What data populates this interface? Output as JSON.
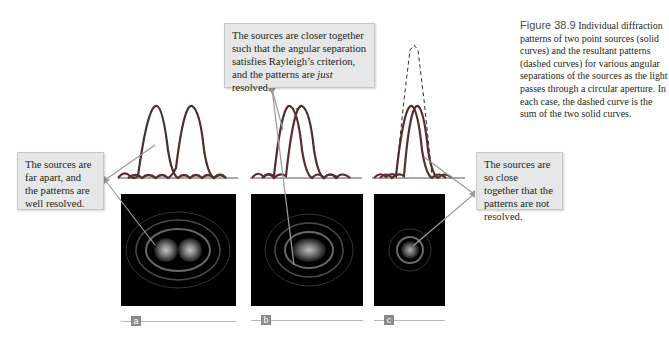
{
  "figure": {
    "number": "Figure 38.9",
    "caption": "Individual diffraction patterns of two point sources (solid curves) and the resultant patterns (dashed curves) for various angular separations of the sources as the light passes through a circular aperture. In each case, the dashed curve is the sum of the two solid curves."
  },
  "callouts": {
    "a": "The sources are far apart, and the patterns are well resolved.",
    "b_pre": "The sources are closer together such that the angular separation satisfies Rayleigh’s criterion, and the patterns are ",
    "b_em": "just",
    "b_post": " resolved.",
    "c": "The sources are so close together that the patterns are not resolved."
  },
  "panels": [
    {
      "label": "a",
      "separation": "far apart",
      "resolved": "well resolved"
    },
    {
      "label": "b",
      "separation": "Rayleigh criterion",
      "resolved": "just resolved"
    },
    {
      "label": "c",
      "separation": "very close",
      "resolved": "not resolved"
    }
  ],
  "colors": {
    "solid_curve": "#5a2e2e",
    "dashed_curve": "#333333",
    "callout_bg": "#e6e7e8",
    "leader_line": "#9b9b9b",
    "label_box": "#8a8a8a"
  }
}
